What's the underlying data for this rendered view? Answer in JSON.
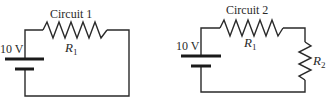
{
  "diagram": {
    "circuits": [
      {
        "title": "Circuit 1",
        "battery": {
          "label": "10 V"
        },
        "resistors": [
          {
            "name": "R",
            "subscript": "1",
            "position": "top"
          }
        ]
      },
      {
        "title": "Circuit 2",
        "battery": {
          "label": "10 V"
        },
        "resistors": [
          {
            "name": "R",
            "subscript": "1",
            "position": "top"
          },
          {
            "name": "R",
            "subscript": "2",
            "position": "right"
          }
        ]
      }
    ],
    "colors": {
      "line": "#2a2a2a",
      "background": "#ffffff"
    }
  }
}
